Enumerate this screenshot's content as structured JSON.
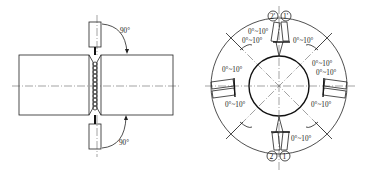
{
  "left_figure": {
    "angle_top": "90°",
    "angle_bottom": "90°"
  },
  "right_figure": {
    "markers_top": [
      "2'",
      "1'"
    ],
    "markers_bottom": [
      "2",
      "1"
    ],
    "angle_labels": [
      "0°~10°",
      "0°~10°",
      "0°~10°",
      "0°~10°",
      "0°~10°",
      "0°~10°",
      "0°~10°",
      "0°~10°",
      "0°~10°"
    ]
  }
}
